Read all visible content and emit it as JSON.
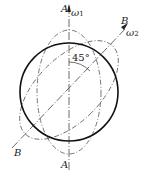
{
  "diagram": {
    "axis_a_label_top": "A",
    "axis_a_label_bottom": "A",
    "axis_b_label_top": "B",
    "axis_b_label_bottom": "B",
    "omega1": "ω",
    "omega1_sub": "1",
    "omega2": "ω",
    "omega2_sub": "2",
    "angle_label": "45°"
  },
  "colors": {
    "stroke": "#222222",
    "dashed": "#555555"
  }
}
